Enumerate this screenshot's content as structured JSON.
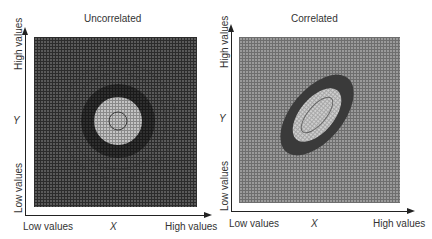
{
  "panels": [
    {
      "title": "Uncorrelated",
      "x_axis": {
        "label": "X",
        "low": "Low values",
        "high": "High values"
      },
      "y_axis": {
        "label": "Y",
        "low": "Low values",
        "high": "High values"
      },
      "contour_shape": "circle",
      "correlation": "none"
    },
    {
      "title": "Correlated",
      "x_axis": {
        "label": "X",
        "low": "Low values",
        "high": "High values"
      },
      "y_axis": {
        "label": "Y",
        "low": "Low values",
        "high": "High values"
      },
      "contour_shape": "tilted-ellipse",
      "correlation": "positive"
    }
  ],
  "colors": {
    "background_left": "#4a4a4a",
    "background_right": "#8a8a8a",
    "ring_dark": "#2e2e2e",
    "inner_light": "#b8b8b8",
    "center_line": "#555555",
    "axis": "#222222",
    "text": "#333333"
  }
}
